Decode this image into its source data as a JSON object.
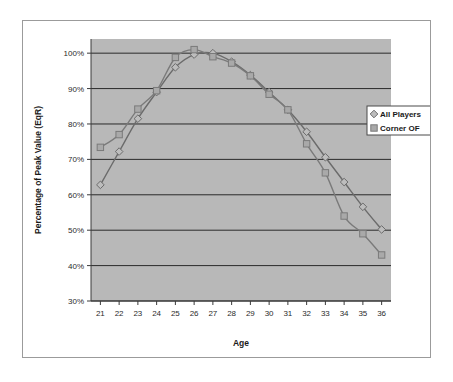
{
  "chart_data": {
    "type": "line",
    "title": "",
    "xlabel": "Age",
    "ylabel": "Percentage of Peak Value (EqR)",
    "x": [
      21,
      22,
      23,
      24,
      25,
      26,
      27,
      28,
      29,
      30,
      31,
      32,
      33,
      34,
      35,
      36
    ],
    "xlim": [
      20.5,
      36.5
    ],
    "ylim": [
      30,
      104
    ],
    "ytick_values": [
      30,
      40,
      50,
      60,
      70,
      80,
      90,
      100
    ],
    "ytick_labels": [
      "30%",
      "40%",
      "50%",
      "60%",
      "70%",
      "80%",
      "90%",
      "100%"
    ],
    "xtick_labels": [
      "21",
      "22",
      "23",
      "24",
      "25",
      "26",
      "27",
      "28",
      "29",
      "30",
      "31",
      "32",
      "33",
      "34",
      "35",
      "36"
    ],
    "grid": "horizontal",
    "legend_position": "right",
    "plot_background": "#b8b8b8",
    "series": [
      {
        "name": "All Players",
        "marker": "diamond",
        "color": "#6b6b6b",
        "values": [
          62.8,
          72.2,
          81.5,
          89.0,
          96.0,
          99.6,
          100.0,
          97.6,
          93.8,
          89.0,
          84.0,
          77.8,
          70.6,
          63.6,
          56.6,
          50.2
        ]
      },
      {
        "name": "Corner OF",
        "marker": "square",
        "color": "#7a7a7a",
        "values": [
          73.4,
          77.0,
          84.2,
          89.4,
          98.8,
          101.0,
          99.0,
          97.2,
          93.6,
          88.4,
          84.0,
          74.4,
          66.2,
          54.0,
          49.0,
          43.0
        ]
      }
    ]
  },
  "legend": {
    "entries": [
      {
        "label": "All Players",
        "marker": "diamond"
      },
      {
        "label": "Corner OF",
        "marker": "square"
      }
    ]
  },
  "axes": {
    "x_title": "Age",
    "y_title": "Percentage of Peak Value (EqR)"
  }
}
